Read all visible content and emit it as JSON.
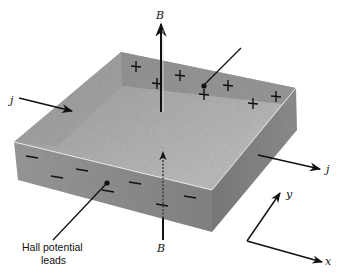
{
  "diagram": {
    "labels": {
      "b_top": "B",
      "b_bottom": "B",
      "j_in": "j",
      "j_out": "j",
      "axis_y": "y",
      "axis_x": "x",
      "hall_leads_line1": "Hall potential",
      "hall_leads_line2": "leads"
    },
    "charges": {
      "back_face_sign": "+",
      "front_face_sign": "−",
      "back_face_count": 8,
      "front_face_count": 8
    },
    "colors": {
      "top_face": "#a9a9a9",
      "front_face": "#8c8c8c",
      "right_face": "#7a7a7a",
      "inner_wall": "#9a9a9a",
      "ink": "#111111"
    }
  }
}
